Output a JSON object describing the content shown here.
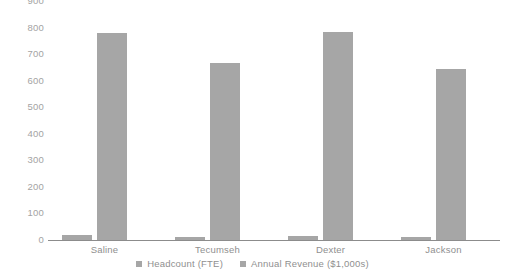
{
  "chart_data": {
    "type": "bar",
    "title": "",
    "subtitle": "",
    "xlabel": "",
    "ylabel": "",
    "ylim": [
      0,
      900
    ],
    "ytick_step": 100,
    "yticks": [
      900,
      800,
      700,
      600,
      500,
      400,
      300,
      200,
      100,
      0
    ],
    "grid": false,
    "legend_position": "bottom-center",
    "categories": [
      "Saline",
      "Tecumseh",
      "Dexter",
      "Jackson"
    ],
    "series": [
      {
        "name": "Headcount (FTE)",
        "color": "#a6a6a6",
        "values": [
          18,
          12,
          14,
          11
        ]
      },
      {
        "name": "Annual Revenue ($1,000s)",
        "color": "#a6a6a6",
        "values": [
          780,
          665,
          782,
          645
        ]
      }
    ],
    "axis_color": "#8c8c8c",
    "tick_label_color": "#a3a3a3",
    "category_label_color": "#8f8f8f"
  }
}
